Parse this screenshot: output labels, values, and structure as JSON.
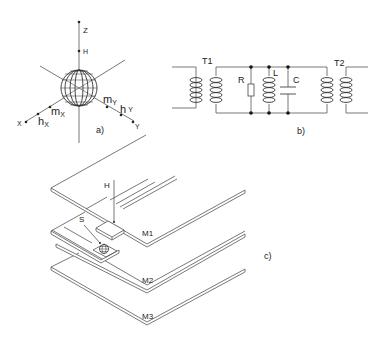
{
  "figure": {
    "panel_a": {
      "caption": "a)",
      "axis_labels": {
        "z": "Z",
        "x": "X",
        "y": "Y",
        "h": "H"
      },
      "moment_labels": {
        "mx": "m",
        "mx_sub": "X",
        "my": "m",
        "my_sub": "Y",
        "hx": "h",
        "hx_sub": "X",
        "hy": "h",
        "hy_sub": "Y"
      }
    },
    "panel_b": {
      "caption": "b)",
      "components": {
        "t1": "T1",
        "t2": "T2",
        "r": "R",
        "l": "L",
        "c": "C"
      }
    },
    "panel_c": {
      "caption": "c)",
      "labels": {
        "h": "H",
        "s": "S",
        "m1": "M1",
        "m2": "M2",
        "m3": "M3"
      }
    }
  }
}
